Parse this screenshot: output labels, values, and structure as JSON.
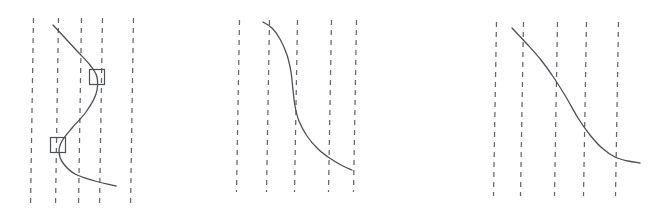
{
  "figure": {
    "title": "",
    "background_color": "#ffffff",
    "width": 664,
    "height": 212,
    "line_color": "#4c5054",
    "grid_color": "#62666b",
    "marker_color": "#4c5054"
  },
  "chart_data": {
    "type": "line",
    "title": "",
    "xlabel": "",
    "ylabel": "",
    "grid": "vertical-dashed",
    "legend": "none",
    "panel_count": 3,
    "panels": [
      {
        "name": "left-panel",
        "label": "",
        "xlim": [
          20,
          160
        ],
        "ylim": [
          0,
          212
        ],
        "gridlines_x": [
          32,
          57,
          80,
          101,
          132
        ],
        "gridline_y_extent": [
          18,
          206
        ],
        "series": [
          {
            "name": "s-curve",
            "shape": "reverse-s",
            "points": [
              [
                53,
                25
              ],
              [
                66,
                39
              ],
              [
                78,
                52
              ],
              [
                90,
                65
              ],
              [
                97,
                77
              ],
              [
                96,
                94
              ],
              [
                86,
                112
              ],
              [
                72,
                128
              ],
              [
                62,
                141
              ],
              [
                59,
                152
              ],
              [
                63,
                163
              ],
              [
                75,
                174
              ],
              [
                95,
                181
              ],
              [
                116,
                186
              ]
            ]
          }
        ],
        "markers": [
          {
            "name": "upper-square-marker",
            "shape": "square",
            "cx": 97,
            "cy": 77,
            "size": 15
          },
          {
            "name": "lower-square-marker",
            "shape": "square",
            "cx": 58,
            "cy": 145,
            "size": 15
          }
        ]
      },
      {
        "name": "middle-panel",
        "label": "",
        "xlim": [
          230,
          390
        ],
        "ylim": [
          0,
          212
        ],
        "gridlines_x": [
          238,
          268,
          296,
          330,
          355
        ],
        "gridline_y_extent": [
          20,
          192
        ],
        "series": [
          {
            "name": "steep-s-curve",
            "shape": "reverse-s",
            "points": [
              [
                263,
                22
              ],
              [
                272,
                28
              ],
              [
                280,
                39
              ],
              [
                287,
                55
              ],
              [
                291,
                72
              ],
              [
                293,
                90
              ],
              [
                295,
                106
              ],
              [
                299,
                121
              ],
              [
                307,
                136
              ],
              [
                318,
                149
              ],
              [
                331,
                159
              ],
              [
                343,
                166
              ],
              [
                352,
                170
              ]
            ]
          }
        ],
        "markers": []
      },
      {
        "name": "right-panel",
        "label": "",
        "xlim": [
          480,
          660
        ],
        "ylim": [
          0,
          212
        ],
        "gridlines_x": [
          495,
          522,
          556,
          585,
          617
        ],
        "gridline_y_extent": [
          22,
          196
        ],
        "series": [
          {
            "name": "descending-curve",
            "shape": "sigmoid-decreasing",
            "points": [
              [
                512,
                28
              ],
              [
                527,
                44
              ],
              [
                541,
                60
              ],
              [
                554,
                78
              ],
              [
                566,
                97
              ],
              [
                578,
                118
              ],
              [
                590,
                135
              ],
              [
                602,
                148
              ],
              [
                615,
                157
              ],
              [
                628,
                161
              ],
              [
                640,
                163
              ]
            ]
          }
        ],
        "markers": []
      }
    ]
  }
}
